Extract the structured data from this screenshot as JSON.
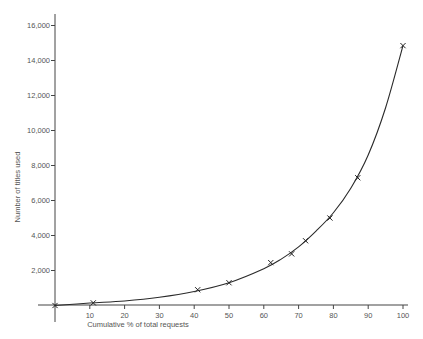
{
  "chart_data": {
    "type": "line",
    "title": "",
    "xlabel": "Cumulative % of total requests",
    "ylabel": "Number of titles used",
    "xlim": [
      0,
      100
    ],
    "ylim": [
      0,
      17000
    ],
    "x_ticks": [
      10,
      20,
      30,
      40,
      50,
      60,
      70,
      80,
      90,
      100
    ],
    "y_ticks": [
      2000,
      4000,
      6000,
      8000,
      10000,
      12000,
      14000,
      16000
    ],
    "y_tick_labels": [
      "2,000",
      "4,000",
      "6,000",
      "8,000",
      "10,000",
      "12,000",
      "14,000",
      "16,000"
    ],
    "grid": false,
    "legend": null,
    "series": [
      {
        "name": "Observed",
        "marker": "x",
        "points": [
          {
            "x": 0,
            "y": 0
          },
          {
            "x": 11,
            "y": 150
          },
          {
            "x": 41,
            "y": 900
          },
          {
            "x": 50,
            "y": 1300
          },
          {
            "x": 62,
            "y": 2450
          },
          {
            "x": 68,
            "y": 2950
          },
          {
            "x": 72,
            "y": 3700
          },
          {
            "x": 79,
            "y": 5000
          },
          {
            "x": 87,
            "y": 7300
          },
          {
            "x": 100,
            "y": 14850
          }
        ]
      },
      {
        "name": "Fitted curve",
        "marker": "none",
        "points": [
          {
            "x": 0,
            "y": 0
          },
          {
            "x": 10,
            "y": 140
          },
          {
            "x": 20,
            "y": 260
          },
          {
            "x": 30,
            "y": 470
          },
          {
            "x": 40,
            "y": 800
          },
          {
            "x": 50,
            "y": 1300
          },
          {
            "x": 60,
            "y": 2100
          },
          {
            "x": 65,
            "y": 2650
          },
          {
            "x": 70,
            "y": 3350
          },
          {
            "x": 75,
            "y": 4250
          },
          {
            "x": 80,
            "y": 5300
          },
          {
            "x": 85,
            "y": 6700
          },
          {
            "x": 90,
            "y": 8600
          },
          {
            "x": 95,
            "y": 11300
          },
          {
            "x": 100,
            "y": 14850
          }
        ]
      }
    ],
    "colors": {
      "line": "#2a2a2a",
      "axis": "#444444",
      "text": "#555555"
    }
  }
}
